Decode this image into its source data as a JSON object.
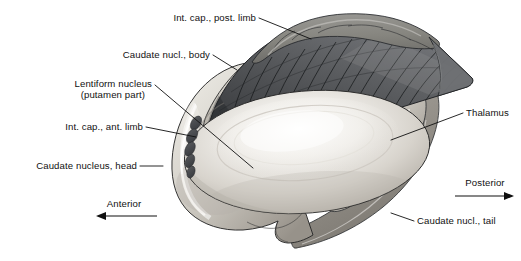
{
  "figure": {
    "background_color": "#ffffff",
    "width": 521,
    "height": 261
  },
  "labels": [
    {
      "id": "int-cap-post-limb",
      "text": "Int. cap., post. limb",
      "anchor": "end",
      "x": 256,
      "y": 21
    },
    {
      "id": "caudate-nucl-body",
      "text": "Caudate nucl., body",
      "anchor": "end",
      "x": 210,
      "y": 58
    },
    {
      "id": "lentiform-nucleus-line1",
      "text": "Lentiform nucleus",
      "anchor": "end",
      "x": 152,
      "y": 87
    },
    {
      "id": "lentiform-nucleus-line2",
      "text": "(putamen part)",
      "anchor": "end",
      "x": 145,
      "y": 98
    },
    {
      "id": "int-cap-ant-limb",
      "text": "Int. cap., ant. limb",
      "anchor": "end",
      "x": 143,
      "y": 130
    },
    {
      "id": "caudate-nucleus-head",
      "text": "Caudate nucleus, head",
      "anchor": "end",
      "x": 137,
      "y": 169
    },
    {
      "id": "thalamus",
      "text": "Thalamus",
      "anchor": "start",
      "x": 466,
      "y": 116
    },
    {
      "id": "caudate-nucl-tail",
      "text": "Caudate nucl., tail",
      "anchor": "start",
      "x": 417,
      "y": 224
    }
  ],
  "direction_markers": [
    {
      "id": "anterior",
      "text": "Anterior",
      "x": 124,
      "y": 207,
      "arrow_direction": "left"
    },
    {
      "id": "posterior",
      "text": "Posterior",
      "x": 485,
      "y": 186,
      "arrow_direction": "right"
    }
  ],
  "structures": [
    {
      "id": "caudate-nucleus-head",
      "name": "Caudate nucleus, head",
      "tone": "light-gray"
    },
    {
      "id": "caudate-nucleus-body",
      "name": "Caudate nucl., body",
      "tone": "light-gray"
    },
    {
      "id": "caudate-nucleus-tail",
      "name": "Caudate nucl., tail",
      "tone": "mid-gray"
    },
    {
      "id": "lentiform-nucleus",
      "name": "Lentiform nucleus (putamen part)",
      "tone": "pale-gray"
    },
    {
      "id": "internal-capsule-posterior-limb",
      "name": "Int. cap., post. limb",
      "tone": "dark-gray-striated"
    },
    {
      "id": "internal-capsule-anterior-limb",
      "name": "Int. cap., ant. limb",
      "tone": "dark-ovals"
    },
    {
      "id": "thalamus",
      "name": "Thalamus",
      "tone": "mid-gray-band"
    }
  ],
  "colors": {
    "background": "#ffffff",
    "ink": "#111111",
    "lentiform_light": "#eceae5",
    "lentiform_shade": "#b9b5ae",
    "caudate_light": "#dedbd4",
    "caudate_shade": "#a9a49c",
    "capsule_dark": "#4d4f52",
    "capsule_darkest": "#2e3033",
    "capsule_top": "#8b8a86",
    "thalamus_band": "#a5a29b",
    "tail_band": "#97948d",
    "outline": "#2a2a2a"
  }
}
